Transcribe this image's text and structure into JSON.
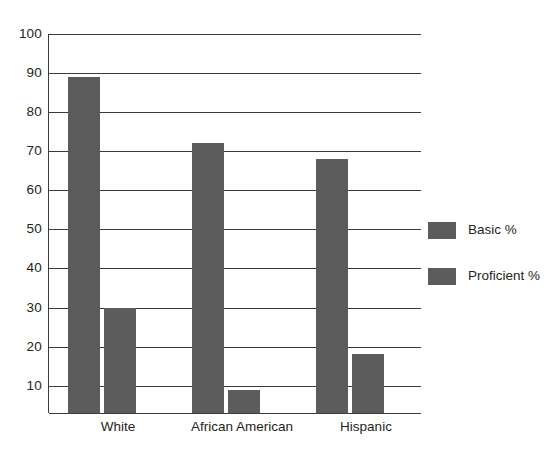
{
  "chart_data": {
    "type": "bar",
    "title": "",
    "subtitle": "",
    "xlabel": "",
    "ylabel": "",
    "categories": [
      "White",
      "African American",
      "Hispanic"
    ],
    "series": [
      {
        "name": "Basic %",
        "values": [
          89,
          72,
          68
        ]
      },
      {
        "name": "Proficient %",
        "values": [
          30,
          9,
          18
        ]
      }
    ],
    "ylim": [
      3,
      100
    ],
    "y_ticks": [
      10,
      20,
      30,
      40,
      50,
      60,
      70,
      80,
      90,
      100
    ],
    "y_tick_labels": [
      "10",
      "20",
      "30",
      "40",
      "50",
      "60",
      "70",
      "80",
      "90",
      "100"
    ],
    "grid": true,
    "grid_axis": "y",
    "legend_position": "right",
    "bar_color": "#5c5c5c",
    "axis_color": "#3b3b3b",
    "background": "#ffffff"
  },
  "legend": {
    "entries": [
      {
        "label": "Basic %",
        "color": "#5c5c5c"
      },
      {
        "label": "Proficient %",
        "color": "#5c5c5c"
      }
    ]
  },
  "y_axis": {
    "ticks": [
      "100",
      "90",
      "80",
      "70",
      "60",
      "50",
      "40",
      "30",
      "20",
      "10"
    ]
  },
  "x_axis": {
    "labels": [
      "White",
      "African American",
      "Hispanic"
    ]
  }
}
